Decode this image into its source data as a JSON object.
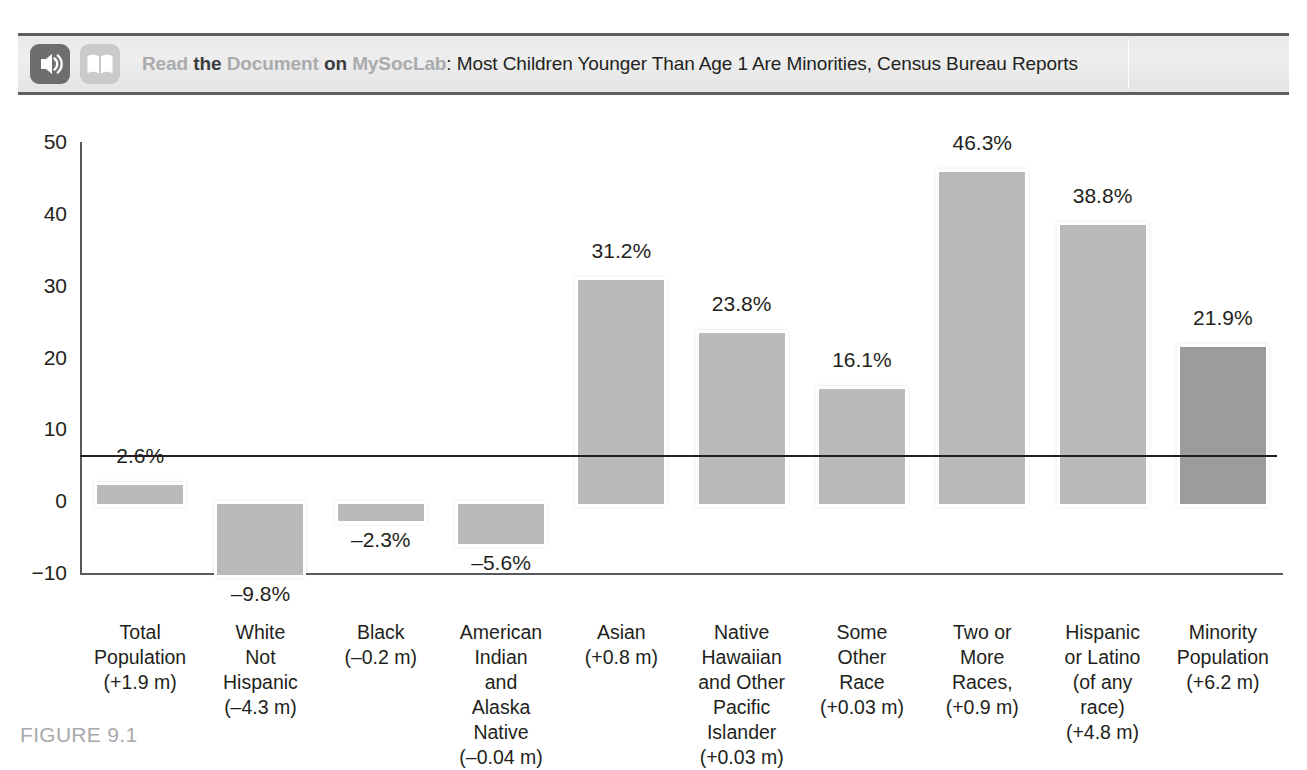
{
  "banner": {
    "audio_icon": "audio-waves-icon",
    "book_icon": "open-book-icon",
    "lead1": "Read",
    "conj1": "the",
    "lead2": "Document",
    "conj2": "on",
    "lead3": "MySocLab",
    "title": ": Most Children Younger Than Age 1 Are Minorities, Census Bureau Reports"
  },
  "caption": {
    "figure_number": "FIGURE 9.1"
  },
  "colors": {
    "bar_light": "#b9babc",
    "bar_dark": "#9b9c9e",
    "bar_outline": "#ffffff",
    "axis": "#58595b",
    "zero_line": "#231f20",
    "banner_bg": "#e9e9e9",
    "banner_rule": "#5a5f63",
    "caption_gray": "#a7a9ac",
    "banner_muted_text": "#a9abad"
  },
  "chart_data": {
    "type": "bar",
    "title": "",
    "xlabel": "",
    "ylabel": "",
    "ylim": [
      -10,
      50
    ],
    "yticks": [
      50,
      40,
      30,
      20,
      10,
      0,
      -10
    ],
    "ytick_labels": [
      "50",
      "40",
      "30",
      "20",
      "10",
      "0",
      "−10"
    ],
    "grid": false,
    "legend": null,
    "categories": [
      "Total\nPopulation\n(+1.9 m)",
      "White\nNot\nHispanic\n(–4.3 m)",
      "Black\n(–0.2 m)",
      "American\nIndian\nand\nAlaska\nNative\n(–0.04 m)",
      "Asian\n(+0.8 m)",
      "Native\nHawaiian\nand Other\nPacific\nIslander\n(+0.03 m)",
      "Some\nOther\nRace\n(+0.03 m)",
      "Two or\nMore\nRaces,\n(+0.9 m)",
      "Hispanic\nor Latino\n(of any\nrace)\n(+4.8 m)",
      "Minority\nPopulation\n(+6.2 m)"
    ],
    "values": [
      2.6,
      -9.8,
      -2.3,
      -5.6,
      31.2,
      23.8,
      16.1,
      46.3,
      38.8,
      21.9
    ],
    "value_labels": [
      "2.6%",
      "–9.8%",
      "–2.3%",
      "–5.6%",
      "31.2%",
      "23.8%",
      "16.1%",
      "46.3%",
      "38.8%",
      "21.9%"
    ],
    "bar_styles": [
      "light",
      "light",
      "light",
      "light",
      "light",
      "light",
      "light",
      "light",
      "light",
      "dark"
    ]
  }
}
